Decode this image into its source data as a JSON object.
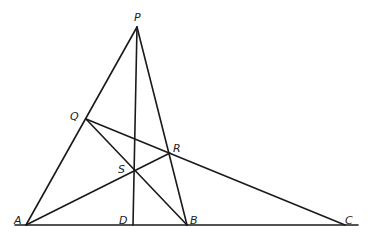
{
  "diagram": {
    "type": "geometry",
    "points": {
      "P": {
        "label": "P",
        "x": 137,
        "y": 27,
        "lx": 134,
        "ly": 21
      },
      "Q": {
        "label": "Q",
        "x": 86,
        "y": 119,
        "lx": 70,
        "ly": 120
      },
      "R": {
        "label": "R",
        "x": 170,
        "y": 153,
        "lx": 173,
        "ly": 152
      },
      "S": {
        "label": "S",
        "x": 134,
        "y": 170,
        "lx": 118,
        "ly": 173
      },
      "A": {
        "label": "A",
        "x": 26,
        "y": 225,
        "lx": 14,
        "ly": 224
      },
      "D": {
        "label": "D",
        "x": 133,
        "y": 225,
        "lx": 119,
        "ly": 224
      },
      "B": {
        "label": "B",
        "x": 187,
        "y": 225,
        "lx": 190,
        "ly": 224
      },
      "C": {
        "label": "C",
        "x": 345,
        "y": 225,
        "lx": 345,
        "ly": 224
      }
    },
    "segments": [
      {
        "name": "baseline",
        "x1": 15,
        "y1": 225,
        "x2": 358,
        "y2": 225
      },
      {
        "name": "segment-AP",
        "from": "A",
        "to": "P"
      },
      {
        "name": "segment-PB",
        "from": "P",
        "to": "B"
      },
      {
        "name": "segment-PD",
        "from": "P",
        "to": "D"
      },
      {
        "name": "segment-QC",
        "from": "Q",
        "to": "C"
      },
      {
        "name": "segment-QB",
        "from": "Q",
        "to": "B"
      },
      {
        "name": "segment-AR",
        "from": "A",
        "to": "R"
      }
    ]
  }
}
